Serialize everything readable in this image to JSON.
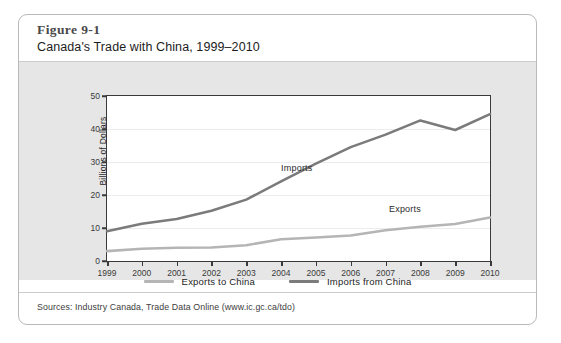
{
  "figure": {
    "number": "Figure 9-1",
    "title": "Canada's Trade with China, 1999–2010",
    "source": "Sources: Industry Canada, Trade Data Online (www.ic.gc.ca/tdo)"
  },
  "legend": {
    "items": [
      {
        "label": "Exports to China",
        "color": "#b5b5b5"
      },
      {
        "label": "Imports from China",
        "color": "#7b7b7b"
      }
    ]
  },
  "annotations": {
    "imports": "Imports",
    "exports": "Exports"
  },
  "colors": {
    "card_border": "#b9b9b9",
    "chart_band": "#e6e6e6",
    "plot_background": "#ffffff",
    "axis": "#3a3a3a",
    "gridline": "#ececec",
    "exports_line": "#b5b5b5",
    "imports_line": "#7b7b7b"
  },
  "chart_data": {
    "type": "line",
    "title": "Canada's Trade with China, 1999–2010",
    "xlabel": "",
    "ylabel": "Billions of Dollars",
    "x": [
      1999,
      2000,
      2001,
      2002,
      2003,
      2004,
      2005,
      2006,
      2007,
      2008,
      2009,
      2010
    ],
    "categories": [
      "1999",
      "2000",
      "2001",
      "2002",
      "2003",
      "2004",
      "2005",
      "2006",
      "2007",
      "2008",
      "2009",
      "2010"
    ],
    "xtick_labels": [
      "1999",
      "2000",
      "2001",
      "2002",
      "2003",
      "2004",
      "2005",
      "2006",
      "2007",
      "2008",
      "2009",
      "2010"
    ],
    "ytick_labels": [
      "0",
      "10",
      "20",
      "30",
      "40",
      "50"
    ],
    "yticks": [
      0,
      10,
      20,
      30,
      40,
      50
    ],
    "ylim": [
      0,
      50
    ],
    "xlim": [
      1999,
      2010
    ],
    "grid": true,
    "legend_position": "bottom-center",
    "series": [
      {
        "name": "Exports to China",
        "legend_label": "Exports to China",
        "inline_label": "Exports",
        "color": "#b5b5b5",
        "values": [
          3.0,
          3.7,
          4.0,
          4.1,
          4.8,
          6.6,
          7.1,
          7.7,
          9.3,
          10.4,
          11.2,
          13.2
        ]
      },
      {
        "name": "Imports from China",
        "legend_label": "Imports from China",
        "inline_label": "Imports",
        "color": "#7b7b7b",
        "values": [
          9.0,
          11.3,
          12.7,
          15.2,
          18.6,
          24.1,
          29.5,
          34.5,
          38.3,
          42.6,
          39.7,
          44.5
        ]
      }
    ]
  }
}
